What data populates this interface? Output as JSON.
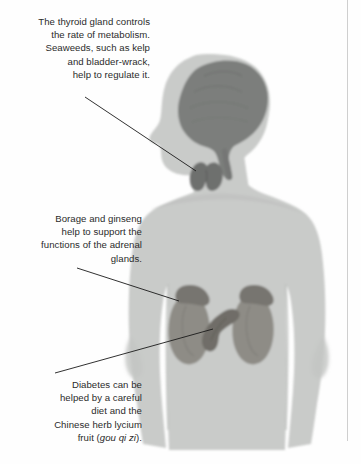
{
  "page": {
    "background_color": "#fefefe",
    "margin_rule_color": "#cfcfcf"
  },
  "colors": {
    "body_fill": "#c9cbc9",
    "body_shadow": "#bcbebc",
    "brain_fill": "#7c7e7c",
    "thyroid_fill": "#6e706e",
    "kidney_fill": "#8e8c86",
    "adrenal_fill": "#77756f",
    "pancreas_fill": "#6f6d67",
    "leader_line": "#1a1a1a",
    "text": "#2b2b2b"
  },
  "captions": [
    {
      "id": "thyroid",
      "name": "thyroid-caption",
      "lines": [
        "The thyroid gland controls",
        "the rate of metabolism.",
        "Seaweeds, such as kelp",
        "and bladder-wrack,",
        "help to regulate it."
      ],
      "text": "The thyroid gland controls\nthe rate of metabolism.\nSeaweeds, such as kelp\nand bladder-wrack,\nhelp to regulate it."
    },
    {
      "id": "adrenal",
      "name": "adrenal-caption",
      "lines": [
        "Borage and ginseng",
        "help to support the",
        "functions of the adrenal",
        "glands."
      ],
      "text": "Borage and ginseng\nhelp to support the\nfunctions of the adrenal\nglands."
    },
    {
      "id": "diabetes",
      "name": "diabetes-caption",
      "lines": [
        "Diabetes can be",
        "helped by a careful",
        "diet and the",
        "Chinese herb lycium",
        "fruit (gou qi zi)."
      ],
      "text_before_italic": "Diabetes can be\nhelped by a careful\ndiet and the\nChinese herb lycium\nfruit (",
      "italic_term": "gou qi zi",
      "text_after_italic": ")."
    }
  ],
  "organs": [
    {
      "id": "brain",
      "label": "brain"
    },
    {
      "id": "thyroid",
      "label": "thyroid gland"
    },
    {
      "id": "adrenal-left",
      "label": "left adrenal gland"
    },
    {
      "id": "adrenal-right",
      "label": "right adrenal gland"
    },
    {
      "id": "kidney-left",
      "label": "left kidney"
    },
    {
      "id": "kidney-right",
      "label": "right kidney"
    },
    {
      "id": "pancreas",
      "label": "pancreas"
    }
  ],
  "leader_lines": [
    {
      "id": "thyroid-leader",
      "from": [
        85,
        97
      ],
      "to": [
        196,
        171
      ]
    },
    {
      "id": "adrenal-leader",
      "from": [
        77,
        268
      ],
      "to": [
        179,
        301
      ]
    },
    {
      "id": "diabetes-leader",
      "from": [
        55,
        373
      ],
      "to": [
        213,
        329
      ]
    }
  ]
}
